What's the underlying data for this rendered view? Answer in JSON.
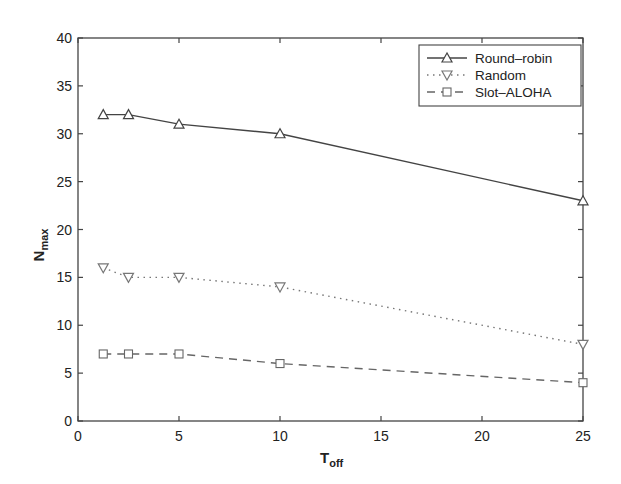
{
  "chart_data": {
    "type": "line",
    "title": "",
    "xlabel": "T",
    "xlabel_sub": "off",
    "ylabel": "N",
    "ylabel_sub": "max",
    "xlim": [
      0,
      25
    ],
    "ylim": [
      0,
      40
    ],
    "x_ticks": [
      0,
      5,
      10,
      15,
      20,
      25
    ],
    "y_ticks": [
      0,
      5,
      10,
      15,
      20,
      25,
      30,
      35,
      40
    ],
    "grid": false,
    "legend_position": "upper right",
    "x": [
      1.25,
      2.5,
      5,
      10,
      25
    ],
    "series": [
      {
        "name": "Round–robin",
        "values": [
          32,
          32,
          31,
          30,
          23
        ],
        "line_style": "solid",
        "marker": "triangle-up",
        "color": "#444444"
      },
      {
        "name": "Random",
        "values": [
          16,
          15,
          15,
          14,
          8
        ],
        "line_style": "dotted",
        "marker": "triangle-down",
        "color": "#777777"
      },
      {
        "name": "Slot–ALOHA",
        "values": [
          7,
          7,
          7,
          6,
          4
        ],
        "line_style": "dashed",
        "marker": "square",
        "color": "#666666"
      }
    ]
  }
}
